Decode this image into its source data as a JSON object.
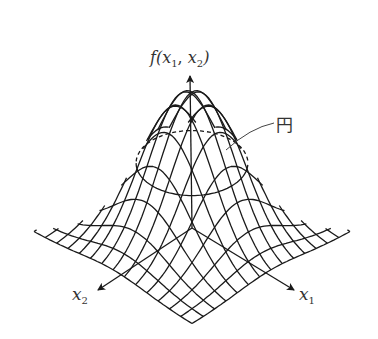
{
  "diagram": {
    "type": "3d-surface-wireframe",
    "axes": {
      "vertical": {
        "label_func": "f",
        "label_arg1": "x",
        "label_sub1": "1",
        "label_sep": ", ",
        "label_arg2": "x",
        "label_sub2": "2"
      },
      "x1": {
        "label": "x",
        "sub": "1"
      },
      "x2": {
        "label": "x",
        "sub": "2"
      }
    },
    "annotation": {
      "label": "円",
      "target": "dashed level-set circle on surface"
    },
    "grid_lines_per_direction": 15,
    "colors": {
      "line": "#1a1a1a",
      "background": "#ffffff",
      "text": "#333333"
    }
  }
}
